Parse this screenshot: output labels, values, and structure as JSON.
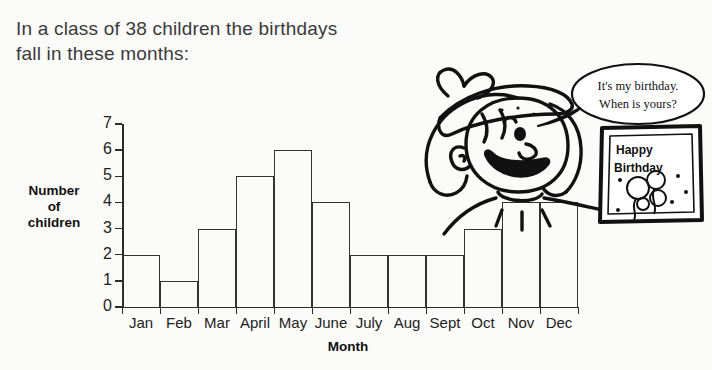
{
  "intro": {
    "line1": "In a class of 38 children the birthdays",
    "line2": "fall in these months:"
  },
  "chart_data": {
    "type": "bar",
    "title": "",
    "xlabel": "Month",
    "ylabel": "Number of children",
    "categories": [
      "Jan",
      "Feb",
      "Mar",
      "April",
      "May",
      "June",
      "July",
      "Aug",
      "Sept",
      "Oct",
      "Nov",
      "Dec"
    ],
    "values": [
      2,
      1,
      3,
      5,
      6,
      4,
      2,
      2,
      2,
      3,
      4,
      4
    ],
    "ylim": [
      0,
      7
    ],
    "yticks": [
      "0",
      "1",
      "2",
      "3",
      "4",
      "5",
      "6",
      "7"
    ],
    "grid": false,
    "legend": "none",
    "total": 38
  },
  "axis": {
    "y_title_line1": "Number",
    "y_title_line2": "of",
    "y_title_line3": "children",
    "x_title": "Month"
  },
  "cartoon": {
    "speech_line1": "It's my birthday.",
    "speech_line2": "When is yours?",
    "card_line1": "Happy",
    "card_line2": "Birthday"
  },
  "colors": {
    "background": "#fbfbf9",
    "ink": "#2b2b2b",
    "text": "#3a3a3a",
    "bar_stroke": "#333333"
  }
}
